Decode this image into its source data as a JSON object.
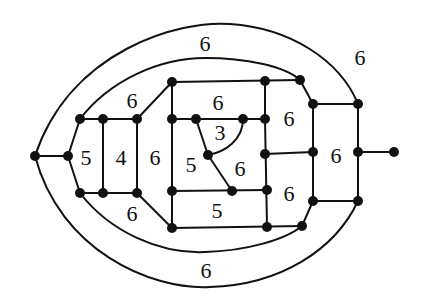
{
  "diagram": {
    "type": "planar-graph",
    "colors": {
      "stroke": "#111111",
      "background": "#ffffff"
    },
    "vertices": [
      {
        "id": "L",
        "x": 35,
        "y": 156
      },
      {
        "id": "A",
        "x": 68,
        "y": 156
      },
      {
        "id": "B",
        "x": 80,
        "y": 119
      },
      {
        "id": "C",
        "x": 103,
        "y": 119
      },
      {
        "id": "D",
        "x": 137,
        "y": 119
      },
      {
        "id": "E",
        "x": 80,
        "y": 193
      },
      {
        "id": "F",
        "x": 103,
        "y": 193
      },
      {
        "id": "G",
        "x": 137,
        "y": 193
      },
      {
        "id": "H",
        "x": 172,
        "y": 82
      },
      {
        "id": "I",
        "x": 265,
        "y": 81
      },
      {
        "id": "J",
        "x": 300,
        "y": 80
      },
      {
        "id": "K",
        "x": 172,
        "y": 119
      },
      {
        "id": "M",
        "x": 196,
        "y": 119
      },
      {
        "id": "N",
        "x": 243,
        "y": 119
      },
      {
        "id": "O",
        "x": 265,
        "y": 119
      },
      {
        "id": "P",
        "x": 208,
        "y": 155
      },
      {
        "id": "Q",
        "x": 265,
        "y": 154
      },
      {
        "id": "R",
        "x": 172,
        "y": 191
      },
      {
        "id": "S",
        "x": 232,
        "y": 191
      },
      {
        "id": "T",
        "x": 267,
        "y": 190
      },
      {
        "id": "U",
        "x": 172,
        "y": 228
      },
      {
        "id": "V",
        "x": 267,
        "y": 227
      },
      {
        "id": "W",
        "x": 302,
        "y": 226
      },
      {
        "id": "X",
        "x": 313,
        "y": 104
      },
      {
        "id": "Y",
        "x": 358,
        "y": 104
      },
      {
        "id": "Z",
        "x": 313,
        "y": 152
      },
      {
        "id": "AA",
        "x": 358,
        "y": 152
      },
      {
        "id": "AB",
        "x": 313,
        "y": 201
      },
      {
        "id": "AC",
        "x": 358,
        "y": 201
      },
      {
        "id": "AD",
        "x": 394,
        "y": 152
      }
    ],
    "face_labels": [
      {
        "label": "6",
        "x": 205,
        "y": 43
      },
      {
        "label": "6",
        "x": 360,
        "y": 57
      },
      {
        "label": "6",
        "x": 132,
        "y": 100
      },
      {
        "label": "5",
        "x": 86,
        "y": 157
      },
      {
        "label": "4",
        "x": 121,
        "y": 157
      },
      {
        "label": "6",
        "x": 155,
        "y": 157
      },
      {
        "label": "6",
        "x": 218,
        "y": 102
      },
      {
        "label": "3",
        "x": 220,
        "y": 132
      },
      {
        "label": "5",
        "x": 191,
        "y": 164
      },
      {
        "label": "6",
        "x": 240,
        "y": 168
      },
      {
        "label": "6",
        "x": 289,
        "y": 118
      },
      {
        "label": "6",
        "x": 336,
        "y": 155
      },
      {
        "label": "6",
        "x": 289,
        "y": 193
      },
      {
        "label": "5",
        "x": 217,
        "y": 210
      },
      {
        "label": "6",
        "x": 132,
        "y": 213
      },
      {
        "label": "6",
        "x": 206,
        "y": 270
      }
    ]
  }
}
